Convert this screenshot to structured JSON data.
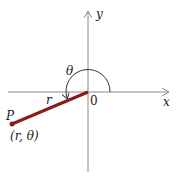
{
  "diagram": {
    "axes": {
      "x_label": "x",
      "y_label": "y",
      "origin_label": "0"
    },
    "angle_label": "θ",
    "radius_label": "r",
    "point_label": "P",
    "point_coords": "(r, θ)",
    "colors": {
      "axis": "#8a8a8a",
      "segment": "#8b1a1a",
      "arc": "#333333"
    }
  }
}
